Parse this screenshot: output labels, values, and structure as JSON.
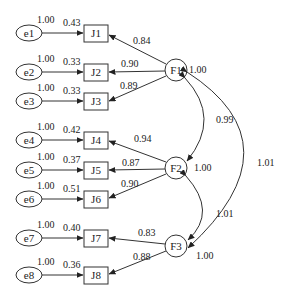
{
  "diagram": {
    "type": "confirmatory factor analysis path diagram",
    "errors": [
      {
        "id": "e1",
        "label": "e1",
        "variance": "1.00",
        "loading": "0.43",
        "indicator": "J1"
      },
      {
        "id": "e2",
        "label": "e2",
        "variance": "1.00",
        "loading": "0.33",
        "indicator": "J2"
      },
      {
        "id": "e3",
        "label": "e3",
        "variance": "1.00",
        "loading": "0.33",
        "indicator": "J3"
      },
      {
        "id": "e4",
        "label": "e4",
        "variance": "1.00",
        "loading": "0.42",
        "indicator": "J4"
      },
      {
        "id": "e5",
        "label": "e5",
        "variance": "1.00",
        "loading": "0.37",
        "indicator": "J5"
      },
      {
        "id": "e6",
        "label": "e6",
        "variance": "1.00",
        "loading": "0.51",
        "indicator": "J6"
      },
      {
        "id": "e7",
        "label": "e7",
        "variance": "1.00",
        "loading": "0.40",
        "indicator": "J7"
      },
      {
        "id": "e8",
        "label": "e8",
        "variance": "1.00",
        "loading": "0.36",
        "indicator": "J8"
      }
    ],
    "indicators": [
      "J1",
      "J2",
      "J3",
      "J4",
      "J5",
      "J6",
      "J7",
      "J8"
    ],
    "factors": [
      {
        "id": "F1",
        "label": "F1",
        "variance": "1.00",
        "loadings": [
          {
            "to": "J1",
            "value": "0.84"
          },
          {
            "to": "J2",
            "value": "0.90"
          },
          {
            "to": "J3",
            "value": "0.89"
          }
        ]
      },
      {
        "id": "F2",
        "label": "F2",
        "variance": "1.00",
        "loadings": [
          {
            "to": "J4",
            "value": "0.94"
          },
          {
            "to": "J5",
            "value": "0.87"
          },
          {
            "to": "J6",
            "value": "0.90"
          }
        ]
      },
      {
        "id": "F3",
        "label": "F3",
        "variance": "1.00",
        "loadings": [
          {
            "to": "J7",
            "value": "0.83"
          },
          {
            "to": "J8",
            "value": "0.88"
          }
        ]
      }
    ],
    "covariances": [
      {
        "between": [
          "F1",
          "F2"
        ],
        "value": "0.99"
      },
      {
        "between": [
          "F2",
          "F3"
        ],
        "value": "1.01"
      },
      {
        "between": [
          "F1",
          "F3"
        ],
        "value": "1.01"
      }
    ]
  }
}
